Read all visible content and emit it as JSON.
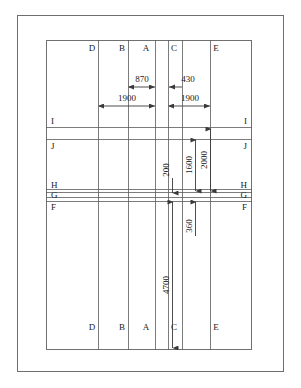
{
  "diagram": {
    "type": "engineering-section-drawing",
    "units": "mm",
    "colors": {
      "line": "#4d4d4d",
      "frame": "#6e6e6e",
      "text": "#1a1a1a",
      "background": "#ffffff"
    },
    "column_labels_top": [
      {
        "id": "D",
        "label": "D",
        "x": 92
      },
      {
        "id": "B",
        "label": "B",
        "x": 122
      },
      {
        "id": "A",
        "label": "A",
        "x": 146
      },
      {
        "id": "C",
        "label": "C",
        "x": 172
      },
      {
        "id": "E",
        "label": "E",
        "x": 214
      }
    ],
    "column_labels_bottom": [
      {
        "id": "D",
        "label": "D",
        "x": 92
      },
      {
        "id": "B",
        "label": "B",
        "x": 122
      },
      {
        "id": "A",
        "label": "A",
        "x": 146
      },
      {
        "id": "C",
        "label": "C",
        "x": 172
      },
      {
        "id": "E",
        "label": "E",
        "x": 214
      }
    ],
    "row_labels_left": [
      {
        "id": "I",
        "label": "I",
        "y": 122
      },
      {
        "id": "J",
        "label": "J",
        "y": 145
      },
      {
        "id": "H",
        "label": "H",
        "y": 186
      },
      {
        "id": "G",
        "label": "G",
        "y": 196
      },
      {
        "id": "F",
        "label": "F",
        "y": 207
      }
    ],
    "row_labels_right": [
      {
        "id": "I",
        "label": "I",
        "y": 122
      },
      {
        "id": "J",
        "label": "J",
        "y": 145
      },
      {
        "id": "H",
        "label": "H",
        "y": 186
      },
      {
        "id": "G",
        "label": "G",
        "y": 196
      },
      {
        "id": "F",
        "label": "F",
        "y": 207
      }
    ],
    "dimensions_horizontal": [
      {
        "id": "dim-870",
        "value": "870",
        "from_x": 128,
        "to_x": 155,
        "y": 87,
        "label_y": 80
      },
      {
        "id": "dim-430",
        "value": "430",
        "from_x": 168,
        "to_x": 182,
        "y": 87,
        "label_y": 80
      },
      {
        "id": "dim-1900-left",
        "value": "1900",
        "from_x": 98,
        "to_x": 155,
        "y": 106,
        "label_y": 99
      },
      {
        "id": "dim-1900-right",
        "value": "1900",
        "from_x": 168,
        "to_x": 210,
        "y": 106,
        "label_y": 99
      }
    ],
    "dimensions_vertical": [
      {
        "id": "dim-200",
        "value": "200",
        "x": 172,
        "from_y": 160,
        "to_y": 193,
        "label_y": 152
      },
      {
        "id": "dim-1600",
        "value": "1600",
        "x": 195,
        "from_y": 139,
        "to_y": 192,
        "label_y": 168
      },
      {
        "id": "dim-2000",
        "value": "2000",
        "x": 210,
        "from_y": 130,
        "to_y": 192,
        "label_y": 163
      },
      {
        "id": "dim-360",
        "value": "360",
        "x": 195,
        "from_y": 201,
        "to_y": 234,
        "label_y": 224
      },
      {
        "id": "dim-4700",
        "value": "4700",
        "x": 172,
        "from_y": 202,
        "to_y": 348,
        "label_y": 285
      }
    ],
    "vertical_rules": [
      98,
      128,
      155,
      168,
      182,
      210
    ],
    "horizontal_rules": [
      127,
      139,
      189,
      192,
      196,
      200
    ]
  }
}
